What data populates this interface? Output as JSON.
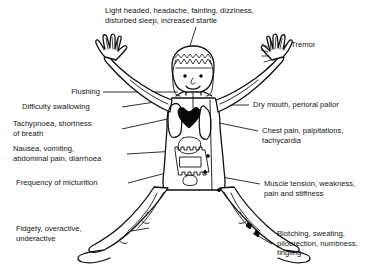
{
  "diagram": {
    "background_color": "#ffffff",
    "line_color": "#101010",
    "text_color": "#141414"
  },
  "labels": {
    "head": {
      "id": "light-headed",
      "lines": [
        "Light headed, headache, fainting, dizziness,",
        "disturbed sleep, increased startle"
      ],
      "text": "Light headed, headache, fainting, dizziness,\ndisturbed sleep, increased startle",
      "side": "top"
    },
    "tremor": {
      "id": "tremor",
      "lines": [
        "Tremor"
      ],
      "text": "Tremor",
      "side": "right"
    },
    "flushing": {
      "id": "flushing",
      "lines": [
        "Flushing"
      ],
      "text": "Flushing",
      "side": "left"
    },
    "swallowing": {
      "id": "difficulty-swallowing",
      "lines": [
        "Difficulty swallowing"
      ],
      "text": "Difficulty swallowing",
      "side": "left"
    },
    "breathing": {
      "id": "tachypnoea",
      "lines": [
        "Tachypnoea, shortness",
        "of breath"
      ],
      "text": "Tachypnoea, shortness\nof breath",
      "side": "left"
    },
    "gastro": {
      "id": "nausea",
      "lines": [
        "Nausea, vomiting,",
        "abdominal pain, diarrhoea"
      ],
      "text": "Nausea, vomiting,\nabdominal pain, diarrhoea",
      "side": "left"
    },
    "urinary": {
      "id": "frequency-of-micturition",
      "lines": [
        "Frequency of micturition"
      ],
      "text": "Frequency of micturition",
      "side": "left"
    },
    "behaviour": {
      "id": "fidgety",
      "lines": [
        "Fidgety, overactive,",
        "underactive"
      ],
      "text": "Fidgety, overactive,\nunderactive",
      "side": "left"
    },
    "mouth": {
      "id": "dry-mouth",
      "lines": [
        "Dry mouth, perioral pallor"
      ],
      "text": "Dry mouth, perioral pallor",
      "side": "right"
    },
    "cardiac": {
      "id": "chest-pain",
      "lines": [
        "Chest pain, palpitations,",
        "tachycardia"
      ],
      "text": "Chest pain, palpitations,\ntachycardia",
      "side": "right"
    },
    "muscular": {
      "id": "muscle-tension",
      "lines": [
        "Muscle tension, weakness,",
        "pain and stiffness"
      ],
      "text": "Muscle tension, weakness,\npain and stiffness",
      "side": "right"
    },
    "skin": {
      "id": "blotching",
      "lines": [
        "Blotching, sweating,",
        "piloerection, numbness,",
        "tingling"
      ],
      "text": "Blotching, sweating,\npiloerection, numbness,\ntingling",
      "side": "right"
    }
  }
}
